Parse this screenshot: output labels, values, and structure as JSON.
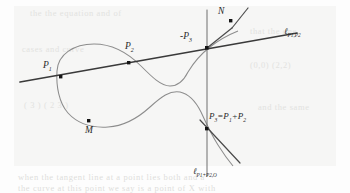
{
  "figure": {
    "kind": "elliptic-curve-group-law",
    "background": "#fdfdfd",
    "paper_tint": "#f6f6f5",
    "curve_color": "#8a8a8a",
    "line_color": "#3a3a3a",
    "point_color": "#1a1a1a",
    "label_color": "#2a2a2a"
  },
  "labels": {
    "p1": "P",
    "p1_sub": "1",
    "p2": "P",
    "p2_sub": "2",
    "minus_p3": "-P",
    "minus_p3_sub": "3",
    "n": "N",
    "m": "M",
    "p3_sum_lead": "P",
    "p3_sum_sub": "3",
    "p3_sum_eq": "=P",
    "p3_sum_sub2": "1",
    "p3_sum_plus": "+P",
    "p3_sum_sub3": "2",
    "line_secant": "ℓ",
    "line_secant_sub": "P1,P2",
    "line_vertical": "ℓ",
    "line_vertical_sub": "P1+P2,O"
  },
  "points": [
    {
      "name": "P1",
      "x": 61,
      "y": 77
    },
    {
      "name": "P2",
      "x": 129,
      "y": 63
    },
    {
      "name": "-P3",
      "x": 207,
      "y": 48
    },
    {
      "name": "N",
      "x": 231,
      "y": 21
    },
    {
      "name": "M",
      "x": 89,
      "y": 121
    },
    {
      "name": "P3",
      "x": 207,
      "y": 129
    }
  ],
  "bleed_text": {
    "b1": "the the equation and of",
    "b2": "that the one",
    "b3": "cases and curve",
    "b4": "(0,0)   (2,2)",
    "b5": "( 3 )     ( 2 3 )",
    "b6": "and the same",
    "b7": "when the tangent line at a point lies both and a",
    "b8": "the curve at this point we say is a point of X with",
    "b9": ""
  }
}
